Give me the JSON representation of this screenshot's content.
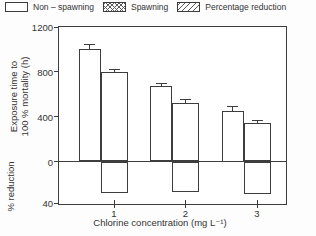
{
  "colors": {
    "ink": "#3d3d3d",
    "text": "#333333",
    "background": "#fdfdfd"
  },
  "legend": {
    "items": [
      {
        "label": "Non – spawning",
        "pattern": "plain"
      },
      {
        "label": "Spawning",
        "pattern": "crosshatch"
      },
      {
        "label": "Percentage reduction",
        "pattern": "diagonal"
      }
    ]
  },
  "chart_data": {
    "type": "bar",
    "title": "",
    "xlabel": "Chlorine concentration (mg L⁻¹)",
    "ylabel_top_line1": "Exposure time to",
    "ylabel_top_line2": "100 % mortality (h)",
    "ylabel_bottom": "% reduction",
    "categories": [
      1,
      2,
      3
    ],
    "xticklabels": [
      "1",
      "2",
      "3"
    ],
    "y_top": {
      "ticks": [
        1200,
        800,
        400,
        0
      ],
      "range": [
        0,
        1200
      ],
      "units": "h"
    },
    "y_bottom": {
      "ticks": [
        40
      ],
      "range": [
        0,
        40
      ],
      "direction": "down",
      "units": "%"
    },
    "grid": false,
    "legend_position": "top",
    "series": [
      {
        "name": "Non – spawning",
        "axis": "top",
        "pattern": "plain",
        "values": [
          1000,
          670,
          450
        ],
        "errors": [
          35,
          25,
          35
        ]
      },
      {
        "name": "Spawning",
        "axis": "top",
        "pattern": "crosshatch",
        "values": [
          795,
          520,
          340
        ],
        "errors": [
          25,
          25,
          25
        ]
      },
      {
        "name": "Percentage reduction",
        "axis": "bottom",
        "pattern": "diagonal",
        "values": [
          30,
          29,
          31
        ]
      }
    ]
  }
}
